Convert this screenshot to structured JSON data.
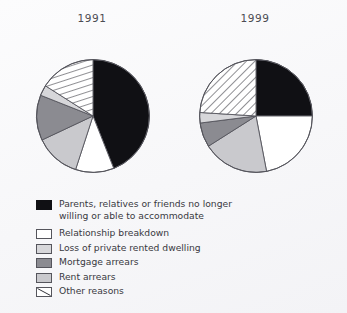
{
  "figure": {
    "background_color": "#fafafa",
    "outline_color": "#55555c"
  },
  "charts": [
    {
      "title": "1991"
    },
    {
      "title": "1999"
    }
  ],
  "legend": {
    "items": [
      {
        "key": "parents",
        "label": "Parents, relatives or friends no longer\nwilling or able to accommodate",
        "swatch": "solid-black",
        "color": "#101014"
      },
      {
        "key": "relationship",
        "label": "Relationship breakdown",
        "swatch": "solid-white",
        "color": "#ffffff"
      },
      {
        "key": "loss_rented",
        "label": "Loss of private rented dwelling",
        "swatch": "solid-light-gray",
        "color": "#d7d7da"
      },
      {
        "key": "mortgage",
        "label": "Mortgage arrears",
        "swatch": "solid-dark-gray",
        "color": "#8b8b91"
      },
      {
        "key": "rent",
        "label": "Rent arrears",
        "swatch": "solid-mid-gray",
        "color": "#c9c9cd"
      },
      {
        "key": "other",
        "label": "Other reasons",
        "swatch": "diagonal-hatch",
        "color": "#ffffff"
      }
    ]
  },
  "chart_data": {
    "type": "pie",
    "title": "",
    "subtitle": "",
    "xlabel": "",
    "ylabel": "",
    "legend_position": "bottom-left",
    "grid": false,
    "start_angle_deg": 0,
    "direction": "clockwise",
    "categories": [
      "Parents, relatives or friends no longer willing or able to accommodate",
      "Relationship breakdown",
      "Other reasons",
      "Loss of private rented dwelling",
      "Mortgage arrears",
      "Rent arrears"
    ],
    "series": [
      {
        "name": "1991",
        "values": [
          44,
          11,
          16,
          3,
          13,
          13
        ],
        "units": "percent",
        "slices": [
          {
            "label": "Parents, relatives or friends no longer willing or able to accommodate",
            "value": 44,
            "fill": "solid-black",
            "color": "#101014"
          },
          {
            "label": "Relationship breakdown",
            "value": 11,
            "fill": "solid-white",
            "color": "#ffffff"
          },
          {
            "label": "Rent arrears",
            "value": 13,
            "fill": "solid-mid-gray",
            "color": "#c9c9cd"
          },
          {
            "label": "Mortgage arrears",
            "value": 13,
            "fill": "solid-dark-gray",
            "color": "#8b8b91"
          },
          {
            "label": "Loss of private rented dwelling",
            "value": 3,
            "fill": "solid-light-gray",
            "color": "#d7d7da"
          },
          {
            "label": "Other reasons",
            "value": 16,
            "fill": "diagonal-hatch",
            "color": "#ffffff"
          }
        ]
      },
      {
        "name": "1999",
        "values": [
          25,
          22,
          24,
          3,
          7,
          19
        ],
        "units": "percent",
        "slices": [
          {
            "label": "Parents, relatives or friends no longer willing or able to accommodate",
            "value": 25,
            "fill": "solid-black",
            "color": "#101014"
          },
          {
            "label": "Relationship breakdown",
            "value": 22,
            "fill": "solid-white",
            "color": "#ffffff"
          },
          {
            "label": "Rent arrears",
            "value": 19,
            "fill": "solid-mid-gray",
            "color": "#c9c9cd"
          },
          {
            "label": "Mortgage arrears",
            "value": 7,
            "fill": "solid-dark-gray",
            "color": "#8b8b91"
          },
          {
            "label": "Loss of private rented dwelling",
            "value": 3,
            "fill": "solid-light-gray",
            "color": "#d7d7da"
          },
          {
            "label": "Other reasons",
            "value": 24,
            "fill": "diagonal-hatch",
            "color": "#ffffff"
          }
        ]
      }
    ]
  }
}
